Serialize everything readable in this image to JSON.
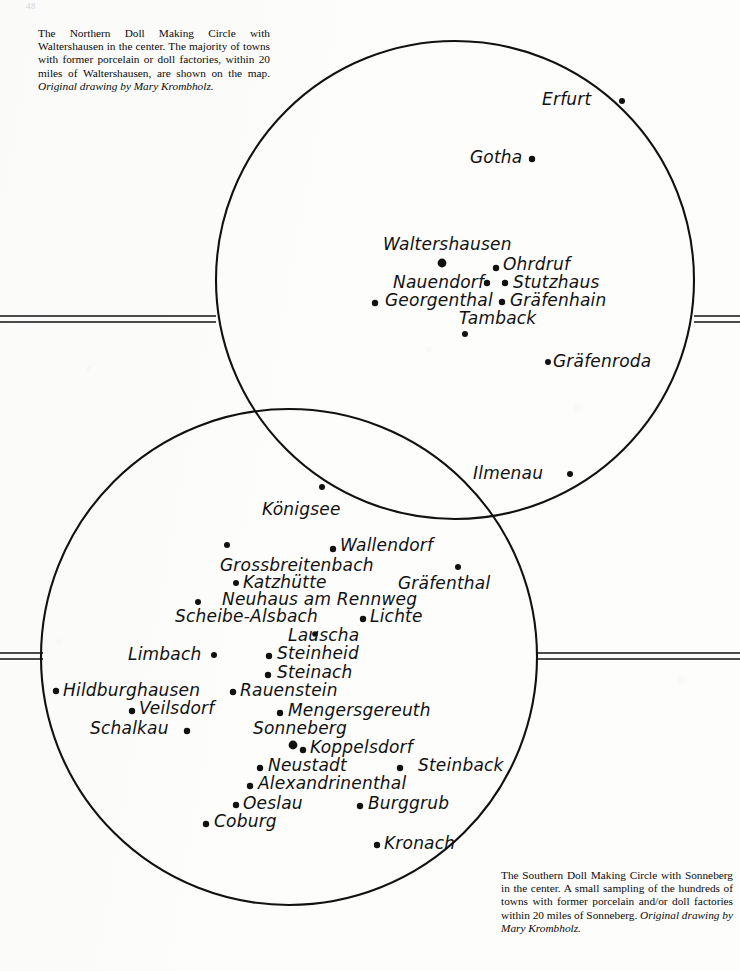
{
  "page": {
    "number": "48",
    "background_color": "#fdfdfc",
    "ink_color": "#111111"
  },
  "captions": {
    "north": {
      "body": "The Northern Doll Making Circle with Waltershausen in the center. The majority of towns with former porcelain or doll factories, within 20 miles of Waltershausen, are shown on the map. ",
      "credit": "Original drawing by Mary Krombholz."
    },
    "south": {
      "body": "The Southern Doll Making Circle with Sonneberg in the center. A small sampling of the hundreds of towns with former porcelain and/or doll factories within 20 miles of Sonneberg. ",
      "credit": "Original drawing by Mary Krombholz."
    }
  },
  "map": {
    "circles": [
      {
        "name": "northern-circle",
        "center_x": 455,
        "center_y": 280,
        "radius": 239,
        "center_town": "Waltershausen"
      },
      {
        "name": "southern-circle",
        "center_x": 289,
        "center_y": 657,
        "radius": 248,
        "center_town": "Sonneberg"
      }
    ],
    "rule_lines": [
      {
        "name": "rule-left-upper",
        "x1": 0,
        "x2": 216,
        "y": 316
      },
      {
        "name": "rule-left-upper2",
        "x1": 0,
        "x2": 216,
        "y": 322
      },
      {
        "name": "rule-right-upper",
        "x1": 694,
        "x2": 740,
        "y": 316
      },
      {
        "name": "rule-right-upper2",
        "x1": 694,
        "x2": 740,
        "y": 322
      },
      {
        "name": "rule-left-lower",
        "x1": 0,
        "x2": 43,
        "y": 653
      },
      {
        "name": "rule-left-lower2",
        "x1": 0,
        "x2": 43,
        "y": 659
      },
      {
        "name": "rule-right-lower",
        "x1": 537,
        "x2": 740,
        "y": 653
      },
      {
        "name": "rule-right-lower2",
        "x1": 537,
        "x2": 740,
        "y": 659
      }
    ],
    "northern_towns": [
      {
        "label": "Erfurt",
        "label_x": 542,
        "label_y": 106,
        "dot_x": 622,
        "dot_y": 101,
        "dot_r": 3.0,
        "size": 17
      },
      {
        "label": "Gotha",
        "label_x": 470,
        "label_y": 164,
        "dot_x": 532,
        "dot_y": 159,
        "dot_r": 3.2,
        "size": 17
      },
      {
        "label": "Waltershausen",
        "label_x": 383,
        "label_y": 251,
        "dot_x": 442,
        "dot_y": 263,
        "dot_r": 4.4,
        "size": 17
      },
      {
        "label": "Ohrdruf",
        "label_x": 503,
        "label_y": 271,
        "dot_x": 496,
        "dot_y": 268,
        "dot_r": 3.2,
        "size": 17
      },
      {
        "label": "Nauendorf",
        "label_x": 393,
        "label_y": 289,
        "dot_x": 487,
        "dot_y": 283,
        "dot_r": 3.2,
        "size": 17
      },
      {
        "label": "Stutzhaus",
        "label_x": 513,
        "label_y": 289,
        "dot_x": 505,
        "dot_y": 283,
        "dot_r": 3.2,
        "size": 17
      },
      {
        "label": "Georgenthal",
        "label_x": 385,
        "label_y": 307,
        "dot_x": 375,
        "dot_y": 303,
        "dot_r": 3.2,
        "size": 17
      },
      {
        "label": "Gräfenhain",
        "label_x": 510,
        "label_y": 307,
        "dot_x": 502,
        "dot_y": 302,
        "dot_r": 3.2,
        "size": 17
      },
      {
        "label": "Tamback",
        "label_x": 459,
        "label_y": 325,
        "dot_x": 465,
        "dot_y": 334,
        "dot_r": 3.0,
        "size": 17
      },
      {
        "label": "Gräfenroda",
        "label_x": 553,
        "label_y": 368,
        "dot_x": 548,
        "dot_y": 362,
        "dot_r": 3.0,
        "size": 17
      },
      {
        "label": "Ilmenau",
        "label_x": 473,
        "label_y": 480,
        "dot_x": 570,
        "dot_y": 474,
        "dot_r": 3.0,
        "size": 17
      }
    ],
    "southern_towns": [
      {
        "label": "Königsee",
        "label_x": 262,
        "label_y": 516,
        "dot_x": 322,
        "dot_y": 487,
        "dot_r": 3.0,
        "size": 17
      },
      {
        "label": "Wallendorf",
        "label_x": 340,
        "label_y": 552,
        "dot_x": 333,
        "dot_y": 549,
        "dot_r": 3.2,
        "size": 17
      },
      {
        "label": "Grossbreitenbach",
        "label_x": 220,
        "label_y": 572,
        "dot_x": 227,
        "dot_y": 545,
        "dot_r": 3.0,
        "size": 17
      },
      {
        "label": "Katzhütte",
        "label_x": 243,
        "label_y": 589,
        "dot_x": 236,
        "dot_y": 583,
        "dot_r": 3.0,
        "size": 17
      },
      {
        "label": "Gräfenthal",
        "label_x": 398,
        "label_y": 590,
        "dot_x": 458,
        "dot_y": 567,
        "dot_r": 3.0,
        "size": 17
      },
      {
        "label": "Neuhaus am Rennweg",
        "label_x": 222,
        "label_y": 606,
        "dot_x": 198,
        "dot_y": 602,
        "dot_r": 3.0,
        "size": 17
      },
      {
        "label": "Scheibe-Alsbach",
        "label_x": 175,
        "label_y": 623,
        "dot_x": 363,
        "dot_y": 619,
        "dot_r": 3.2,
        "size": 17
      },
      {
        "label": "Lichte",
        "label_x": 370,
        "label_y": 623,
        "dot_x": 0,
        "dot_y": 0,
        "dot_r": 0,
        "size": 17
      },
      {
        "label": "Lauscha",
        "label_x": 288,
        "label_y": 642,
        "dot_x": 315,
        "dot_y": 634,
        "dot_r": 2.8,
        "size": 17
      },
      {
        "label": "Limbach",
        "label_x": 128,
        "label_y": 661,
        "dot_x": 214,
        "dot_y": 655,
        "dot_r": 3.0,
        "size": 17
      },
      {
        "label": "Steinheid",
        "label_x": 277,
        "label_y": 660,
        "dot_x": 269,
        "dot_y": 656,
        "dot_r": 3.2,
        "size": 17
      },
      {
        "label": "Steinach",
        "label_x": 277,
        "label_y": 679,
        "dot_x": 268,
        "dot_y": 675,
        "dot_r": 3.2,
        "size": 17
      },
      {
        "label": "Hildburghausen",
        "label_x": 63,
        "label_y": 697,
        "dot_x": 56,
        "dot_y": 691,
        "dot_r": 3.2,
        "size": 17
      },
      {
        "label": "Rauenstein",
        "label_x": 240,
        "label_y": 697,
        "dot_x": 233,
        "dot_y": 692,
        "dot_r": 3.2,
        "size": 17
      },
      {
        "label": "Veilsdorf",
        "label_x": 139,
        "label_y": 715,
        "dot_x": 132,
        "dot_y": 711,
        "dot_r": 3.2,
        "size": 17
      },
      {
        "label": "Mengersgereuth",
        "label_x": 288,
        "label_y": 717,
        "dot_x": 280,
        "dot_y": 713,
        "dot_r": 3.2,
        "size": 17
      },
      {
        "label": "Schalkau",
        "label_x": 90,
        "label_y": 735,
        "dot_x": 187,
        "dot_y": 731,
        "dot_r": 3.2,
        "size": 17
      },
      {
        "label": "Sonneberg",
        "label_x": 253,
        "label_y": 735,
        "dot_x": 293,
        "dot_y": 745,
        "dot_r": 4.4,
        "size": 17
      },
      {
        "label": "Koppelsdorf",
        "label_x": 310,
        "label_y": 754,
        "dot_x": 303,
        "dot_y": 750,
        "dot_r": 3.2,
        "size": 17
      },
      {
        "label": "Neustadt",
        "label_x": 268,
        "label_y": 772,
        "dot_x": 260,
        "dot_y": 768,
        "dot_r": 3.2,
        "size": 17
      },
      {
        "label": "Steinback",
        "label_x": 418,
        "label_y": 772,
        "dot_x": 400,
        "dot_y": 768,
        "dot_r": 3.2,
        "size": 17
      },
      {
        "label": "Alexandrinenthal",
        "label_x": 258,
        "label_y": 790,
        "dot_x": 250,
        "dot_y": 786,
        "dot_r": 3.2,
        "size": 17
      },
      {
        "label": "Oeslau",
        "label_x": 243,
        "label_y": 810,
        "dot_x": 236,
        "dot_y": 805,
        "dot_r": 3.2,
        "size": 17
      },
      {
        "label": "Burggrub",
        "label_x": 368,
        "label_y": 810,
        "dot_x": 360,
        "dot_y": 806,
        "dot_r": 3.2,
        "size": 17
      },
      {
        "label": "Coburg",
        "label_x": 214,
        "label_y": 828,
        "dot_x": 206,
        "dot_y": 824,
        "dot_r": 3.2,
        "size": 17
      },
      {
        "label": "Kronach",
        "label_x": 384,
        "label_y": 850,
        "dot_x": 377,
        "dot_y": 845,
        "dot_r": 3.2,
        "size": 17
      }
    ]
  }
}
